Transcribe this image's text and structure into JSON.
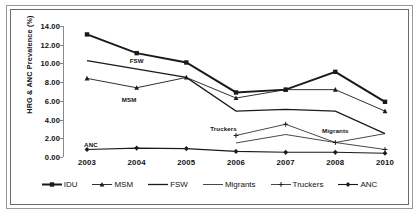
{
  "chart_data": {
    "type": "line",
    "title": "",
    "xlabel": "",
    "ylabel": "HRG & ANC  Prevalence (%)",
    "categories": [
      "2003",
      "2004",
      "2005",
      "2006",
      "2007",
      "2008",
      "2010"
    ],
    "ylim": [
      0,
      14
    ],
    "ytick_labels": [
      "0.00",
      "2.00",
      "4.00",
      "6.00",
      "8.00",
      "10.00",
      "12.00",
      "14.00"
    ],
    "ytick_values": [
      0,
      2,
      4,
      6,
      8,
      10,
      12,
      14
    ],
    "grid": false,
    "legend_position": "bottom",
    "series": [
      {
        "name": "IDU",
        "marker": "square",
        "values": [
          13.1,
          11.1,
          10.1,
          6.9,
          7.2,
          9.1,
          5.9
        ]
      },
      {
        "name": "MSM",
        "marker": "triangle",
        "values": [
          8.4,
          7.4,
          8.5,
          6.3,
          7.2,
          7.2,
          4.9
        ]
      },
      {
        "name": "FSW",
        "marker": "line",
        "values": [
          10.3,
          null,
          8.5,
          4.9,
          5.1,
          4.9,
          2.5
        ]
      },
      {
        "name": "Migrants",
        "marker": "line",
        "values": [
          null,
          null,
          null,
          1.5,
          2.4,
          1.55,
          2.5
        ]
      },
      {
        "name": "Truckers",
        "marker": "plus",
        "values": [
          null,
          null,
          null,
          2.3,
          3.5,
          1.55,
          0.8
        ]
      },
      {
        "name": "ANC",
        "marker": "diamond",
        "values": [
          0.8,
          0.95,
          0.9,
          0.6,
          0.5,
          0.5,
          0.4
        ]
      }
    ],
    "annotations": [
      {
        "text": "FSW",
        "x": 2004.0,
        "y": 10.4
      },
      {
        "text": "MSM",
        "x": 2003.85,
        "y": 6.15
      },
      {
        "text": "ANC",
        "x": 2003.08,
        "y": 1.35
      },
      {
        "text": "Truckers",
        "x": 2005.75,
        "y": 3.15
      },
      {
        "text": "Migrants",
        "x": 2008.0,
        "y": 2.9
      }
    ]
  },
  "legend": {
    "items": [
      {
        "label": "IDU"
      },
      {
        "label": "MSM"
      },
      {
        "label": "FSW"
      },
      {
        "label": "Migrants"
      },
      {
        "label": "Truckers"
      },
      {
        "label": "ANC"
      }
    ]
  },
  "colors": {
    "line": "#1a1a1a",
    "axis": "#8a8a8a",
    "frame": "#6b6b6b",
    "background": "#ffffff"
  }
}
